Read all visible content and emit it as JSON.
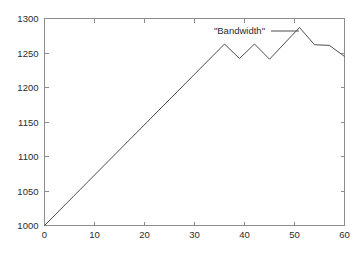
{
  "chart_data": {
    "type": "line",
    "title": "",
    "subtitle": "",
    "xlabel": "",
    "ylabel": "",
    "xlim": [
      0,
      60
    ],
    "ylim": [
      1000,
      1300
    ],
    "xticks": [
      0,
      10,
      20,
      30,
      40,
      50,
      60
    ],
    "yticks": [
      1000,
      1050,
      1100,
      1150,
      1200,
      1250,
      1300
    ],
    "xtick_labels": [
      "0",
      "10",
      "20",
      "30",
      "40",
      "50",
      "60"
    ],
    "ytick_labels": [
      "1000",
      "1050",
      "1100",
      "1150",
      "1200",
      "1250",
      "1300"
    ],
    "grid": false,
    "legend_position": "top-right",
    "legend_entries": [
      "\"Bandwidth\""
    ],
    "annotations": [],
    "series": [
      {
        "name": "\"Bandwidth\"",
        "color": "#4d4d4d",
        "x": [
          0,
          36,
          39,
          42,
          45,
          51,
          54,
          57,
          60
        ],
        "values": [
          1000,
          1263,
          1242,
          1263,
          1241,
          1287,
          1262,
          1261,
          1245
        ]
      }
    ]
  },
  "legend": {
    "label": "\"Bandwidth\""
  },
  "axes": {
    "x_label": "",
    "y_label": ""
  },
  "colors": {
    "line": "#4d4d4d",
    "frame": "#8c8c8c",
    "text": "#2b2b2b",
    "background": "#ffffff"
  }
}
